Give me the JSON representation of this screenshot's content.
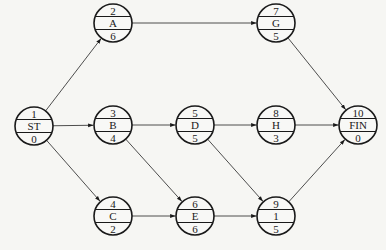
{
  "diagram": {
    "type": "activity-on-node network",
    "nodes": [
      {
        "key": "ST",
        "id": "1",
        "label": "ST",
        "duration": "0",
        "x": 34,
        "y": 126
      },
      {
        "key": "A",
        "id": "2",
        "label": "A",
        "duration": "6",
        "x": 113,
        "y": 23
      },
      {
        "key": "B",
        "id": "3",
        "label": "B",
        "duration": "4",
        "x": 113,
        "y": 125
      },
      {
        "key": "C",
        "id": "4",
        "label": "C",
        "duration": "2",
        "x": 113,
        "y": 216
      },
      {
        "key": "D",
        "id": "5",
        "label": "D",
        "duration": "5",
        "x": 195,
        "y": 125
      },
      {
        "key": "E",
        "id": "6",
        "label": "E",
        "duration": "6",
        "x": 195,
        "y": 216
      },
      {
        "key": "G",
        "id": "7",
        "label": "G",
        "duration": "5",
        "x": 276,
        "y": 23
      },
      {
        "key": "H",
        "id": "8",
        "label": "H",
        "duration": "3",
        "x": 276,
        "y": 125
      },
      {
        "key": "I",
        "id": "9",
        "label": "1",
        "duration": "5",
        "x": 276,
        "y": 216
      },
      {
        "key": "FIN",
        "id": "10",
        "label": "FIN",
        "duration": "0",
        "x": 358,
        "y": 125
      }
    ],
    "edges": [
      {
        "from": "ST",
        "to": "A"
      },
      {
        "from": "ST",
        "to": "B"
      },
      {
        "from": "ST",
        "to": "C"
      },
      {
        "from": "A",
        "to": "G"
      },
      {
        "from": "B",
        "to": "D"
      },
      {
        "from": "B",
        "to": "E"
      },
      {
        "from": "C",
        "to": "E"
      },
      {
        "from": "D",
        "to": "H"
      },
      {
        "from": "D",
        "to": "I"
      },
      {
        "from": "E",
        "to": "I"
      },
      {
        "from": "G",
        "to": "FIN"
      },
      {
        "from": "H",
        "to": "FIN"
      },
      {
        "from": "I",
        "to": "FIN"
      }
    ],
    "radius": 19
  }
}
